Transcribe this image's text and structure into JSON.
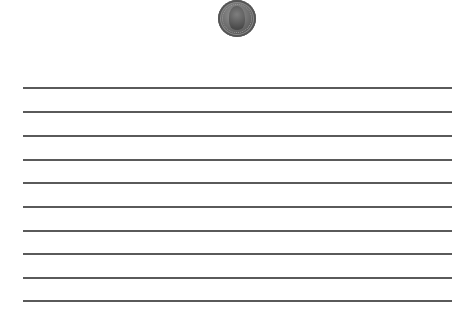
{
  "coin": {
    "name": "penny",
    "center": [
      237,
      18
    ],
    "diameter": 38,
    "color": "#6e6e6e"
  },
  "ruled_lines": {
    "count": 10,
    "x_start": 23,
    "x_end": 452,
    "y_positions": [
      88,
      112,
      136,
      160,
      183,
      207,
      231,
      254,
      278,
      301
    ],
    "color": "#5a5a5a"
  }
}
